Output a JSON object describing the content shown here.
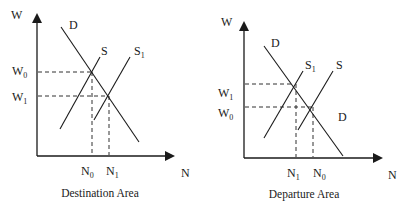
{
  "panels": [
    {
      "id": "destination",
      "caption": "Destination Area",
      "y_axis_label": "W",
      "x_axis_label": "N",
      "curves": {
        "demand": "D",
        "supply": "S",
        "supply_shifted": "S",
        "supply_shifted_sub": "1"
      },
      "y_ticks": [
        {
          "base": "W",
          "sub": "0"
        },
        {
          "base": "W",
          "sub": "1"
        }
      ],
      "x_ticks": [
        {
          "base": "N",
          "sub": "0"
        },
        {
          "base": "N",
          "sub": "1"
        }
      ]
    },
    {
      "id": "departure",
      "caption": "Departure Area",
      "y_axis_label": "W",
      "x_axis_label": "N",
      "curves": {
        "demand": "D",
        "demand_lower": "D",
        "supply": "S",
        "supply_shifted": "S",
        "supply_shifted_sub": "1"
      },
      "y_ticks": [
        {
          "base": "W",
          "sub": "1"
        },
        {
          "base": "W",
          "sub": "0"
        }
      ],
      "x_ticks": [
        {
          "base": "N",
          "sub": "1"
        },
        {
          "base": "N",
          "sub": "0"
        }
      ]
    }
  ]
}
